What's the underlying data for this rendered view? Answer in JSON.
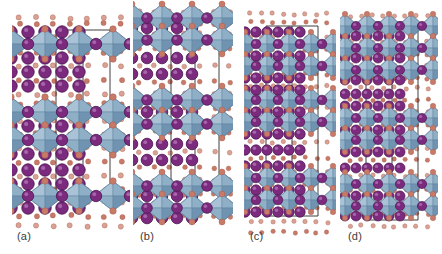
{
  "figure": {
    "background_color": "#ffffff",
    "width": 442,
    "height": 254,
    "caption_style": "panel letters in parentheses below each structure"
  },
  "palette": {
    "octahedron_face_light": "#a9c2d6",
    "octahedron_face_mid": "#8fafc7",
    "octahedron_face_dark": "#6f93b0",
    "octahedron_edge": "#5b7e9c",
    "cation_purple_fill": "#7b2a7e",
    "cation_purple_rim": "#4a1550",
    "cation_purple_highlight": "#b47ab8",
    "oxygen_fill": "#c87a68",
    "oxygen_rim": "#a55a48",
    "oxygen_pale": "#d9a294",
    "cell_edge_line": "#2b2b2b",
    "label_text": "#3b3b3b"
  },
  "legend_semantics": {
    "octahedra": "MO6 coordination polyhedra",
    "large_purple_spheres": "A-site cation",
    "small_salmon_spheres": "oxygen anion",
    "thin_black_lines": "unit cell edges"
  },
  "panels": [
    {
      "id": "a",
      "label": "(a)",
      "label_x": 17,
      "label_y": 231,
      "x": 12,
      "width": 118,
      "structure": {
        "columns": 3,
        "column_spacing": 34,
        "column_offset": 16,
        "octahedron_rx": 19,
        "octahedron_ry": 15,
        "cation_r": 6.2,
        "oxygen_r": 2.6,
        "cell_left": 44,
        "cell_right": 98,
        "cell_top": 30,
        "cell_bottom": 196,
        "slab_rows": [
          {
            "y": 44,
            "type": "octahedra",
            "count": 3
          },
          {
            "y": 112,
            "type": "octahedra",
            "count": 3
          },
          {
            "y": 140,
            "type": "octahedra",
            "count": 3
          },
          {
            "y": 196,
            "type": "octahedra",
            "count": 3
          }
        ],
        "cation_rows": [
          32,
          58,
          72,
          86,
          126,
          154,
          170,
          184,
          208
        ],
        "oxygen_rows": [
          18,
          24,
          38,
          52,
          66,
          80,
          94,
          104,
          120,
          134,
          148,
          162,
          176,
          190,
          202,
          216,
          226
        ]
      }
    },
    {
      "id": "b",
      "label": "(b)",
      "label_x": 140,
      "label_y": 231,
      "x": 133,
      "width": 100,
      "structure": {
        "columns": 3,
        "column_spacing": 30,
        "column_offset": 14,
        "octahedron_rx": 17,
        "octahedron_ry": 14,
        "cation_r": 5.8,
        "oxygen_r": 2.4,
        "cell_left": 38,
        "cell_right": 86,
        "cell_top": 36,
        "cell_bottom": 190,
        "slab_rows": [
          {
            "y": 18,
            "type": "octahedra",
            "count": 4
          },
          {
            "y": 40,
            "type": "octahedra",
            "count": 4
          },
          {
            "y": 100,
            "type": "octahedra",
            "count": 4
          },
          {
            "y": 124,
            "type": "octahedra",
            "count": 4
          },
          {
            "y": 186,
            "type": "octahedra",
            "count": 4
          },
          {
            "y": 208,
            "type": "octahedra",
            "count": 4
          }
        ],
        "cation_rows": [
          28,
          58,
          74,
          112,
          144,
          160,
          196,
          218
        ],
        "oxygen_rows": [
          12,
          24,
          34,
          48,
          66,
          82,
          94,
          108,
          118,
          132,
          152,
          168,
          180,
          194,
          204,
          216
        ]
      }
    },
    {
      "id": "c",
      "label": "(c)",
      "label_x": 250,
      "label_y": 231,
      "x": 244,
      "width": 92,
      "structure": {
        "columns": 4,
        "column_spacing": 22,
        "column_offset": 12,
        "octahedron_rx": 13,
        "octahedron_ry": 12,
        "cation_r": 5.2,
        "oxygen_r": 2.2,
        "cell_left": 22,
        "cell_right": 74,
        "cell_top": 26,
        "cell_bottom": 216,
        "slab_rows": [
          {
            "y": 44,
            "type": "octahedra",
            "count": 4
          },
          {
            "y": 66,
            "type": "octahedra",
            "count": 4
          },
          {
            "y": 100,
            "type": "octahedra",
            "count": 4
          },
          {
            "y": 122,
            "type": "octahedra",
            "count": 4
          },
          {
            "y": 178,
            "type": "octahedra",
            "count": 4
          },
          {
            "y": 200,
            "type": "octahedra",
            "count": 4
          }
        ],
        "cation_rows": [
          32,
          56,
          78,
          90,
          112,
          134,
          150,
          166,
          190,
          212
        ],
        "oxygen_rows": [
          14,
          22,
          38,
          50,
          62,
          74,
          86,
          96,
          108,
          128,
          142,
          158,
          172,
          184,
          196,
          208,
          222,
          232
        ]
      }
    },
    {
      "id": "d",
      "label": "(d)",
      "label_x": 348,
      "label_y": 231,
      "x": 340,
      "width": 98,
      "structure": {
        "columns": 4,
        "column_spacing": 22,
        "column_offset": 16,
        "octahedron_rx": 13,
        "octahedron_ry": 12,
        "cation_r": 5.0,
        "oxygen_r": 2.2,
        "cell_left": 26,
        "cell_right": 78,
        "cell_top": 22,
        "cell_bottom": 220,
        "slab_rows": [
          {
            "y": 26,
            "type": "octahedra",
            "count": 4
          },
          {
            "y": 48,
            "type": "octahedra",
            "count": 4
          },
          {
            "y": 70,
            "type": "octahedra",
            "count": 4
          },
          {
            "y": 118,
            "type": "octahedra",
            "count": 4
          },
          {
            "y": 140,
            "type": "octahedra",
            "count": 4
          },
          {
            "y": 184,
            "type": "octahedra",
            "count": 4
          },
          {
            "y": 206,
            "type": "octahedra",
            "count": 4
          }
        ],
        "cation_rows": [
          36,
          58,
          80,
          94,
          106,
          130,
          152,
          168,
          196,
          216
        ],
        "oxygen_rows": [
          16,
          30,
          42,
          54,
          66,
          78,
          88,
          100,
          112,
          124,
          148,
          160,
          176,
          190,
          202,
          214,
          226
        ]
      }
    }
  ]
}
